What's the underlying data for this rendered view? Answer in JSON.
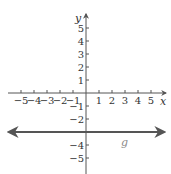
{
  "chart_data": {
    "type": "line",
    "title": "",
    "xlabel": "x",
    "ylabel": "y",
    "xlim": [
      -5,
      5
    ],
    "ylim": [
      -5,
      5
    ],
    "x_ticks": [
      -5,
      -4,
      -3,
      -2,
      -1,
      1,
      2,
      3,
      4,
      5
    ],
    "y_ticks": [
      5,
      4,
      3,
      2,
      1,
      -1,
      -2,
      -3,
      -4,
      -5
    ],
    "x_tick_labels": [
      "−5",
      "−4",
      "−3",
      "−2",
      "−1",
      "1",
      "2",
      "3",
      "4",
      "5"
    ],
    "y_tick_labels": [
      "5",
      "4",
      "3",
      "2",
      "1",
      "−1",
      "−2",
      "−3",
      "−4",
      "−5"
    ],
    "grid": false,
    "series": [
      {
        "name": "g",
        "equation": "y = -3",
        "x": [
          -6,
          6
        ],
        "values": [
          -3,
          -3
        ],
        "color": "#555555",
        "arrows_both_ends": true
      }
    ],
    "annotations": [
      {
        "text": "g",
        "x": 3,
        "y": -3.6
      }
    ]
  },
  "labels": {
    "x_axis": "x",
    "y_axis": "y",
    "series_label": "g"
  },
  "colors": {
    "axis": "#555555",
    "line": "#555555",
    "text": "#333333",
    "series_label": "#888888"
  }
}
